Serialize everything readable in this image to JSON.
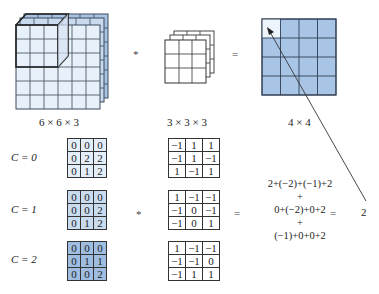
{
  "top_row": {
    "input_label": "6 × 6 × 3",
    "kernel_label": "3 × 3 × 3",
    "output_label": "4 × 4",
    "conv_operator": "*",
    "equals_operator": "="
  },
  "channels": [
    {
      "label": "C = 0",
      "input": [
        [
          "0",
          "0",
          "0"
        ],
        [
          "0",
          "2",
          "2"
        ],
        [
          "0",
          "1",
          "2"
        ]
      ],
      "kernel": [
        [
          "−1",
          "1",
          "1"
        ],
        [
          "−1",
          "1",
          "−1"
        ],
        [
          "1",
          "−1",
          "1"
        ]
      ]
    },
    {
      "label": "C = 1",
      "input": [
        [
          "0",
          "0",
          "0"
        ],
        [
          "0",
          "0",
          "2"
        ],
        [
          "0",
          "1",
          "2"
        ]
      ],
      "kernel": [
        [
          "1",
          "−1",
          "−1"
        ],
        [
          "−1",
          "0",
          "−1"
        ],
        [
          "−1",
          "0",
          "1"
        ]
      ]
    },
    {
      "label": "C = 2",
      "input": [
        [
          "0",
          "0",
          "0"
        ],
        [
          "0",
          "1",
          "1"
        ],
        [
          "0",
          "0",
          "2"
        ]
      ],
      "kernel": [
        [
          "1",
          "−1",
          "−1"
        ],
        [
          "−1",
          "−1",
          "0"
        ],
        [
          "−1",
          "1",
          "1"
        ]
      ]
    }
  ],
  "bottom_ops": {
    "conv_operator": "*",
    "equals_operator_1": "=",
    "equals_operator_2": "="
  },
  "sum": {
    "line1": "2+(−2)+(−1)+2",
    "plus1": "+",
    "line2": "0+(−2)+0+2",
    "plus2": "+",
    "line3": "(−1)+0+0+2"
  },
  "result": "2",
  "colors": {
    "input_front": "#e8f0f9",
    "input_back": "#b7cde6",
    "output_cell": "#a9c5e6",
    "output_first_cell": "#eef4fb",
    "grid_line": "#333333"
  }
}
